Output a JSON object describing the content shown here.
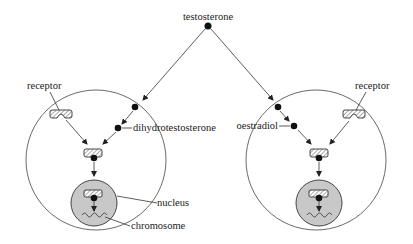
{
  "diagram": {
    "labels": {
      "hormone": "testosterone",
      "left_receptor": "receptor",
      "right_receptor": "receptor",
      "left_metabolite": "dihydrotestosterone",
      "right_metabolite": "oestradiol",
      "nucleus": "nucleus",
      "chromosome": "chromosome"
    },
    "colors": {
      "nucleus_fill": "#c8c8c8",
      "stroke": "#333333",
      "dot": "#111111"
    }
  }
}
